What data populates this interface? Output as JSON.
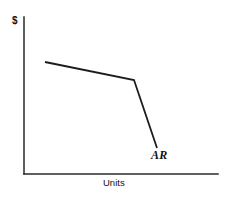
{
  "chart_data": {
    "type": "line",
    "title": "",
    "subtitle": "",
    "xlabel": "Units",
    "ylabel": "$",
    "grid": false,
    "legend_position": "inline-annotation",
    "axis_color": "#2a2a2a",
    "line_color": "#1c1c1c",
    "xlim": [
      0,
      100
    ],
    "ylim": [
      0,
      100
    ],
    "axes": {
      "x_axis_visible": true,
      "y_axis_visible": true,
      "ticks_visible": false,
      "tick_labels": []
    },
    "series": [
      {
        "name": "AR",
        "label": "AR",
        "description": "kinked average revenue (demand) curve",
        "points": [
          {
            "x": 10.8,
            "y": 71.3
          },
          {
            "x": 56.7,
            "y": 59.9
          },
          {
            "x": 68.6,
            "y": 16.6
          }
        ],
        "pixel_points": [
          {
            "x": 45,
            "y": 62
          },
          {
            "x": 134,
            "y": 80
          },
          {
            "x": 157,
            "y": 148
          }
        ]
      }
    ],
    "annotations": [
      {
        "name": "curve-label",
        "text": "AR",
        "style": "bold-italic-serif",
        "x": 151,
        "y": 149
      }
    ]
  },
  "figure": {
    "y_axis_label": "$",
    "x_axis_label": "Units",
    "curve_label": "AR",
    "background_color": "#ffffff"
  }
}
